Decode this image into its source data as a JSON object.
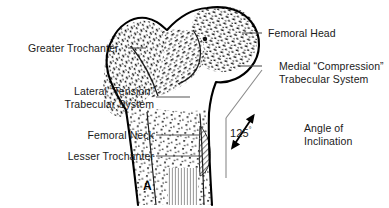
{
  "figure": {
    "label": "A",
    "type": "anatomical-illustration"
  },
  "labels": {
    "femoral_head": "Femoral Head",
    "medial_line1": "Medial “Compression”",
    "medial_line2": "Trabecular System",
    "greater_trochanter": "Greater Trochanter",
    "lateral_line1": "Lateral “Tension”",
    "lateral_line2": "Trabecular System",
    "femoral_neck": "Femoral Neck",
    "lesser_trochanter": "Lesser Trochanter",
    "angle_line1": "Angle of",
    "angle_line2": "Inclination"
  },
  "measurements": {
    "angle_of_inclination_value": "125",
    "angle_of_inclination_unit": "°"
  },
  "colors": {
    "ink": "#1a1a1a",
    "outline": "#000000",
    "leader": "#555555",
    "background": "#ffffff",
    "shade": "#9a9a9a"
  }
}
